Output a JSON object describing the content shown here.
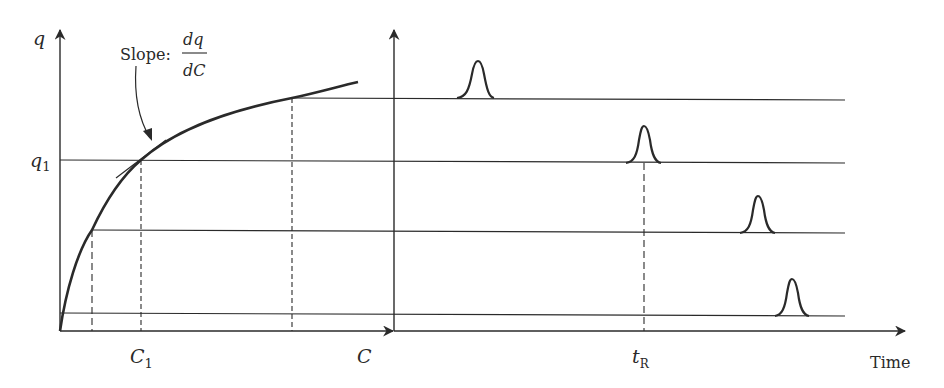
{
  "diagram": {
    "type": "isotherm-and-chromatograms",
    "colors": {
      "ink": "#2a2a2a",
      "background": "#ffffff"
    },
    "left_panel": {
      "y_axis_label": "q",
      "x_axis_label": "C",
      "q1_label": "q",
      "q1_subscript": "1",
      "c1_label": "C",
      "c1_subscript": "1",
      "annotation": {
        "prefix": "Slope: ",
        "numerator": "dq",
        "denominator": "dC"
      }
    },
    "right_panel": {
      "x_axis_label": "Time",
      "tr_label": "t",
      "tr_subscript": "R"
    },
    "chromatograms": [
      {
        "name": "highest-concentration",
        "peak_order": 1
      },
      {
        "name": "q1-concentration",
        "peak_order": 2
      },
      {
        "name": "medium-concentration",
        "peak_order": 3
      },
      {
        "name": "lowest-concentration",
        "peak_order": 4
      }
    ]
  }
}
